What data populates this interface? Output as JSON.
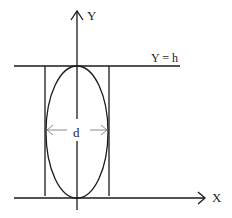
{
  "diagram": {
    "labels": {
      "y_axis": "Y",
      "x_axis": "X",
      "top_line": "Y = h",
      "width": "d"
    },
    "colors": {
      "stroke": "#1a1a1a",
      "dimension": "#8a8a8a",
      "background": "#ffffff"
    }
  }
}
